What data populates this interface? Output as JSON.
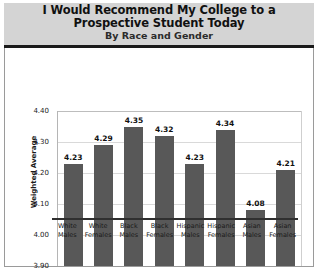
{
  "header": {
    "title": "I Would Recommend My College to a Prospective Student Today",
    "subtitle": "By Race and Gender"
  },
  "chart_data": {
    "type": "bar",
    "title": "I Would Recommend My College to a Prospective Student Today",
    "subtitle": "By Race and Gender",
    "xlabel": "",
    "ylabel": "Weighted Average",
    "ylim": [
      3.9,
      4.4
    ],
    "yticks": [
      "4.40",
      "4.30",
      "4.20",
      "4.10",
      "4.00",
      "3.90"
    ],
    "ytick_values": [
      4.4,
      4.3,
      4.2,
      4.1,
      4.0,
      3.9
    ],
    "grid": true,
    "legend": false,
    "bar_color": "#585858",
    "categories": [
      "White Males",
      "White Females",
      "Black Males",
      "Black Females",
      "Hispanic Males",
      "Hispanic Females",
      "Asian Males",
      "Asian Females"
    ],
    "category_lines": [
      [
        "White",
        "Males"
      ],
      [
        "White",
        "Females"
      ],
      [
        "Black",
        "Males"
      ],
      [
        "Black",
        "Females"
      ],
      [
        "Hispanic",
        "Males"
      ],
      [
        "Hispanic",
        "Females"
      ],
      [
        "Asian",
        "Males"
      ],
      [
        "Asian",
        "Females"
      ]
    ],
    "values": [
      4.23,
      4.29,
      4.35,
      4.32,
      4.23,
      4.34,
      4.08,
      4.21
    ],
    "value_labels": [
      "4.23",
      "4.29",
      "4.35",
      "4.32",
      "4.23",
      "4.34",
      "4.08",
      "4.21"
    ]
  }
}
